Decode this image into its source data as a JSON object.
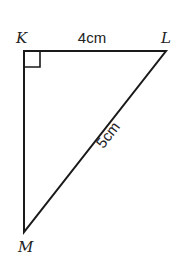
{
  "diagram": {
    "type": "right-triangle",
    "vertices": [
      {
        "id": "K",
        "label": "K",
        "x": 24,
        "y": 51
      },
      {
        "id": "L",
        "label": "L",
        "x": 166,
        "y": 51
      },
      {
        "id": "M",
        "label": "M",
        "x": 24,
        "y": 232
      }
    ],
    "sides": [
      {
        "from": "K",
        "to": "L",
        "label": "4cm"
      },
      {
        "from": "L",
        "to": "M",
        "label": "5cm"
      },
      {
        "from": "K",
        "to": "M",
        "label": ""
      }
    ],
    "right_angle_at": "K",
    "stroke_color": "#1a1a1a"
  }
}
